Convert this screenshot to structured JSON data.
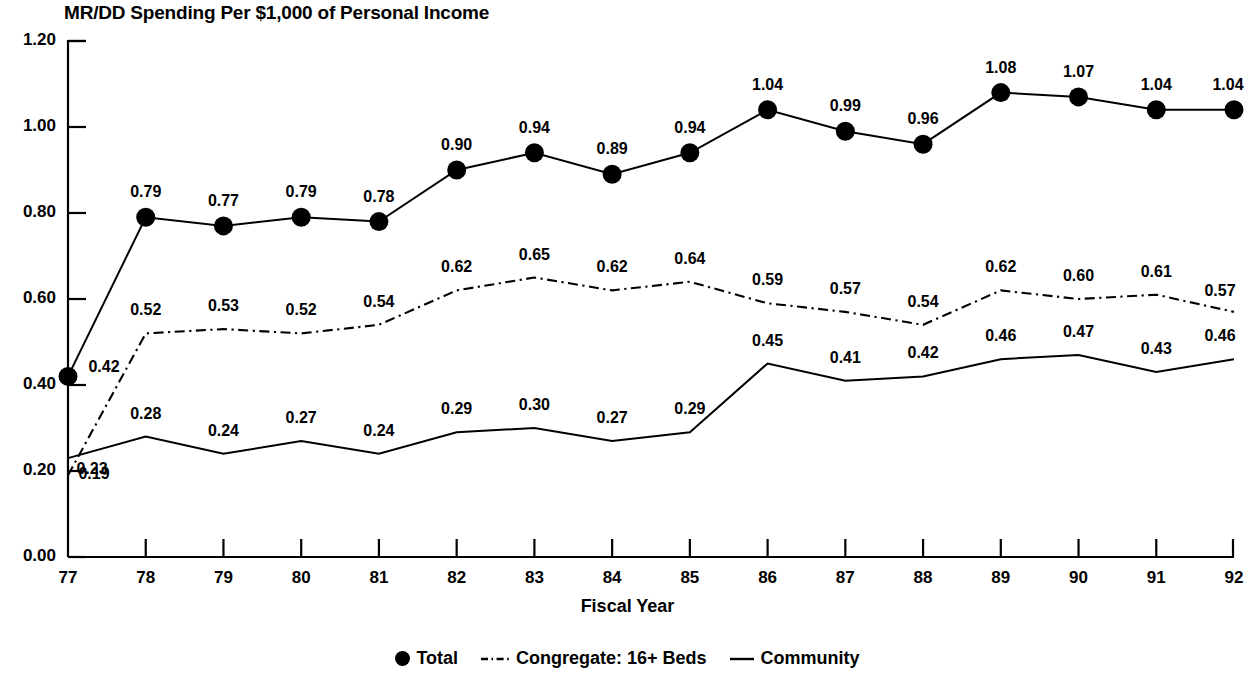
{
  "chart_data": {
    "type": "line",
    "title": "MR/DD Spending Per $1,000 of Personal Income",
    "xlabel": "Fiscal Year",
    "ylabel": "",
    "categories": [
      "77",
      "78",
      "79",
      "80",
      "81",
      "82",
      "83",
      "84",
      "85",
      "86",
      "87",
      "88",
      "89",
      "90",
      "91",
      "92"
    ],
    "ylim": [
      0.0,
      1.2
    ],
    "ytick_labels": [
      "0.00",
      "0.20",
      "0.40",
      "0.60",
      "0.80",
      "1.00",
      "1.20"
    ],
    "ytick_values": [
      0.0,
      0.2,
      0.4,
      0.6,
      0.8,
      1.0,
      1.2
    ],
    "grid": false,
    "legend_position": "bottom",
    "series": [
      {
        "name": "Total",
        "marker": "filled-circle",
        "line_style": "solid",
        "values": [
          0.42,
          0.79,
          0.77,
          0.79,
          0.78,
          0.9,
          0.94,
          0.89,
          0.94,
          1.04,
          0.99,
          0.96,
          1.08,
          1.07,
          1.04,
          1.04
        ],
        "labels": [
          "0.42",
          "0.79",
          "0.77",
          "0.79",
          "0.78",
          "0.90",
          "0.94",
          "0.89",
          "0.94",
          "1.04",
          "0.99",
          "0.96",
          "1.08",
          "1.07",
          "1.04",
          "1.04"
        ]
      },
      {
        "name": "Congregate: 16+ Beds",
        "marker": "none",
        "line_style": "dash-dot",
        "values": [
          0.19,
          0.52,
          0.53,
          0.52,
          0.54,
          0.62,
          0.65,
          0.62,
          0.64,
          0.59,
          0.57,
          0.54,
          0.62,
          0.6,
          0.61,
          0.57
        ],
        "labels": [
          "0.19",
          "0.52",
          "0.53",
          "0.52",
          "0.54",
          "0.62",
          "0.65",
          "0.62",
          "0.64",
          "0.59",
          "0.57",
          "0.54",
          "0.62",
          "0.60",
          "0.61",
          "0.57"
        ]
      },
      {
        "name": "Community",
        "marker": "none",
        "line_style": "solid",
        "values": [
          0.23,
          0.28,
          0.24,
          0.27,
          0.24,
          0.29,
          0.3,
          0.27,
          0.29,
          0.45,
          0.41,
          0.42,
          0.46,
          0.47,
          0.43,
          0.46
        ],
        "labels": [
          "0.23",
          "0.28",
          "0.24",
          "0.27",
          "0.24",
          "0.29",
          "0.30",
          "0.27",
          "0.29",
          "0.45",
          "0.41",
          "0.42",
          "0.46",
          "0.47",
          "0.43",
          "0.46"
        ]
      }
    ]
  },
  "legend": {
    "items": [
      {
        "label": "Total",
        "swatch": "filled-circle-marker"
      },
      {
        "label": "Congregate: 16+ Beds",
        "swatch": "dash-dot-line"
      },
      {
        "label": "Community",
        "swatch": "solid-line"
      }
    ]
  },
  "colors": {
    "ink": "#000000",
    "background": "#ffffff"
  }
}
